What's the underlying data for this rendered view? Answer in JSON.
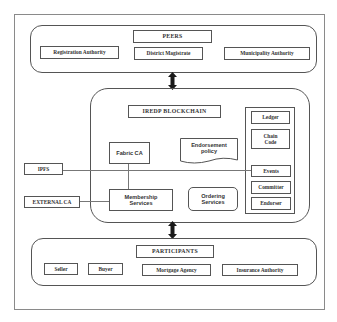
{
  "diagram": {
    "peers": {
      "title": "PEERS",
      "items": [
        {
          "label": "Registration Authority"
        },
        {
          "label": "District Magistrate"
        },
        {
          "label": "Municipality Authority"
        }
      ]
    },
    "blockchain": {
      "title": "IREDP BLOCKCHAIN",
      "fabric_ca": "Fabric CA",
      "endorsement_policy": "Endorsement policy",
      "membership_services": "Membership Services",
      "ordering_services": "Ordering Services",
      "right_column": [
        {
          "label": "Ledger"
        },
        {
          "label": "Chain Code"
        },
        {
          "label": "Events"
        },
        {
          "label": "Committer"
        },
        {
          "label": "Endorser"
        }
      ]
    },
    "external": {
      "ipfs": "IPFS",
      "external_ca": "EXTERNAL CA"
    },
    "participants": {
      "title": "PARTICIPANTS",
      "items": [
        {
          "label": "Seller"
        },
        {
          "label": "Buyer"
        },
        {
          "label": "Mortgage Agency"
        },
        {
          "label": "Insurance Authority"
        }
      ]
    },
    "connectors": [
      {
        "from": "PEERS",
        "to": "IREDP BLOCKCHAIN",
        "type": "bidirectional-arrow"
      },
      {
        "from": "IREDP BLOCKCHAIN",
        "to": "PARTICIPANTS",
        "type": "bidirectional-arrow"
      },
      {
        "from": "IPFS",
        "to": "Events",
        "type": "line"
      },
      {
        "from": "EXTERNAL CA",
        "to": "Membership Services",
        "type": "line"
      },
      {
        "from": "Fabric CA",
        "to": "Membership Services",
        "type": "line"
      }
    ]
  }
}
